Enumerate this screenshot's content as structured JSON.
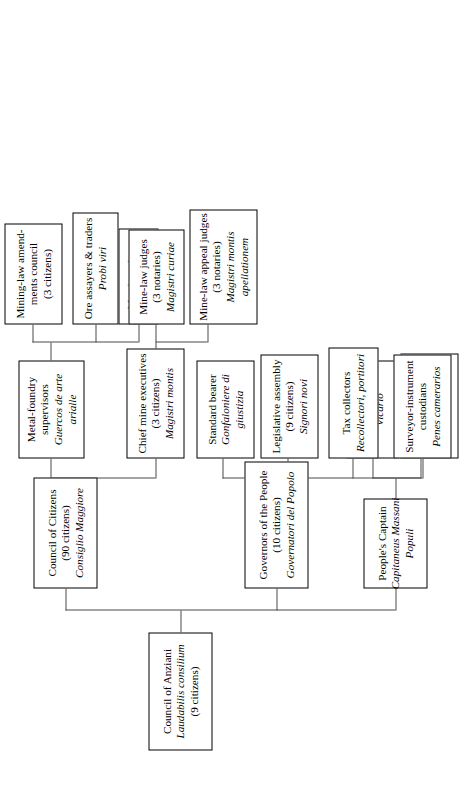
{
  "chart_title": "Government structure of a medieval Italian mining commune",
  "orientation": "rotated-90-ccw",
  "nodes": {
    "root": {
      "line1": "Council of Anziani",
      "line2": "Laudabilis consilium",
      "line3": "(9 citizens)"
    },
    "peoples_captain": {
      "line1": "People's Captain",
      "line2": "Capitaneus Massani",
      "line3": "Populi"
    },
    "assistant_judge": {
      "line1": "Assistant judge",
      "line2": "Vicario"
    },
    "appeals_court_judge": {
      "line1": "Appeals court judge",
      "line2": "Magister",
      "line3": "appellationem"
    },
    "governors": {
      "line1": "Governors of the People",
      "line2": "(10 citizens)",
      "line3": "Governatori del Popolo"
    },
    "standard_bearer": {
      "line1": "Standard bearer",
      "line2": "Gonfaloniere di",
      "line3": "giustizia"
    },
    "legislative_assembly": {
      "line1": "Legislative assembly",
      "line2": "(9 citizens)",
      "line3": "Signori novi"
    },
    "tax_collectors": {
      "line1": "Tax collectors",
      "line2": "Recollectori, portitori"
    },
    "surveyor_custodians": {
      "line1": "Surveyor-instrument",
      "line2": "custodians",
      "line3": "Penes camerarios"
    },
    "council_of_citizens": {
      "line1": "Council of Citizens",
      "line2": "(90 citizens)",
      "line3": "Consiglio Maggiore"
    },
    "chief_mine_executives": {
      "line1": "Chief mine executives",
      "line2": "(3 citizens)",
      "line3": "Magistri montis"
    },
    "mine_law_judges": {
      "line1": "Mine-law judges",
      "line2": "(3 notaries)",
      "line3": "Magistri curiae"
    },
    "mine_law_appeal_judges": {
      "line1": "Mine-law appeal judges",
      "line2": "(3 notaries)",
      "line3": "Magistri montis",
      "line4": "apellationem"
    },
    "metal_foundry_supervisors": {
      "line1": "Metal-foundry",
      "line2": "supervisors",
      "line3": "Guercos de arte",
      "line4": "arialle"
    },
    "mining_law_amendments": {
      "line1": "Mining-law amend-",
      "line2": "ments council",
      "line3": "(3 citizens)"
    },
    "ore_assayers": {
      "line1": "Ore assayers & traders",
      "line2": "Probi viri"
    },
    "metal_smelters": {
      "line1": "Metal smelters",
      "line2": "Colatori"
    }
  },
  "colors": {
    "box_border": "#000000",
    "connector": "#4a4a4a",
    "background": "#ffffff",
    "text": "#000000"
  }
}
